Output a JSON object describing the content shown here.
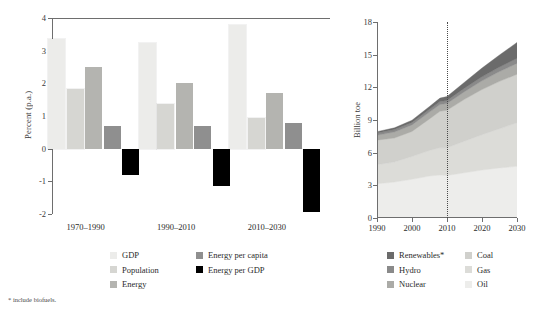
{
  "figure": {
    "footnote": "* include biofuels."
  },
  "left": {
    "ylabel": "Percent (p.a.)",
    "y_ticks": [
      "4",
      "3",
      "2",
      "1",
      "0",
      "-1",
      "-2"
    ],
    "group_labels": [
      "1970–1990",
      "1990–2010",
      "2010–2030"
    ],
    "legend": [
      {
        "label": "GDP",
        "color": "#ececea"
      },
      {
        "label": "Energy per capita",
        "color": "#8f8f8f"
      },
      {
        "label": "Population",
        "color": "#d6d6d2"
      },
      {
        "label": "Energy per GDP",
        "color": "#000000"
      },
      {
        "label": "Energy",
        "color": "#b4b4b0"
      }
    ]
  },
  "right": {
    "ylabel": "Billion toe",
    "y_ticks": [
      "18",
      "15",
      "12",
      "9",
      "6",
      "3",
      "0"
    ],
    "x_ticks": [
      "1990",
      "2000",
      "2010",
      "2020",
      "2030"
    ],
    "divider_year": 2010,
    "legend": [
      {
        "label": "Renewables*",
        "color": "#6b6b6b"
      },
      {
        "label": "Coal",
        "color": "#d0d0cc"
      },
      {
        "label": "Hydro",
        "color": "#8a8a8a"
      },
      {
        "label": "Gas",
        "color": "#dcdcd8"
      },
      {
        "label": "Nuclear",
        "color": "#ababa7"
      },
      {
        "label": "Oil",
        "color": "#ededeb"
      }
    ]
  },
  "chart_data": [
    {
      "type": "bar",
      "title": "",
      "xlabel": "",
      "ylabel": "Percent (p.a.)",
      "ylim": [
        -2,
        4
      ],
      "grid": false,
      "legend_position": "bottom-left",
      "categories": [
        "1970–1990",
        "1990–2010",
        "2010–2030"
      ],
      "series": [
        {
          "name": "GDP",
          "color": "#ececea",
          "values": [
            3.35,
            3.22,
            3.8
          ]
        },
        {
          "name": "Population",
          "color": "#d6d6d2",
          "values": [
            1.82,
            1.37,
            0.95
          ]
        },
        {
          "name": "Energy",
          "color": "#b4b4b0",
          "values": [
            2.5,
            2.0,
            1.7
          ]
        },
        {
          "name": "Energy per capita",
          "color": "#8f8f8f",
          "values": [
            0.68,
            0.68,
            0.78
          ]
        },
        {
          "name": "Energy per GDP",
          "color": "#000000",
          "values": [
            -0.8,
            -1.15,
            -1.95
          ]
        }
      ]
    },
    {
      "type": "area",
      "stacked": true,
      "title": "",
      "xlabel": "",
      "ylabel": "Billion toe",
      "xlim": [
        1990,
        2030
      ],
      "ylim": [
        0,
        18
      ],
      "grid": false,
      "legend_position": "bottom",
      "annotation": "dotted vertical line at 2010 separating history from projection",
      "x": [
        1990,
        1995,
        2000,
        2005,
        2008,
        2010,
        2015,
        2020,
        2025,
        2030
      ],
      "series": [
        {
          "name": "Oil",
          "color": "#ededeb",
          "values": [
            3.15,
            3.3,
            3.55,
            3.85,
            3.95,
            3.9,
            4.15,
            4.4,
            4.6,
            4.75
          ]
        },
        {
          "name": "Gas",
          "color": "#dcdcd8",
          "values": [
            1.75,
            1.85,
            2.1,
            2.35,
            2.5,
            2.55,
            2.9,
            3.25,
            3.6,
            4.0
          ]
        },
        {
          "name": "Coal",
          "color": "#d0d0cc",
          "values": [
            2.25,
            2.2,
            2.3,
            2.9,
            3.35,
            3.45,
            3.85,
            4.15,
            4.35,
            4.45
          ]
        },
        {
          "name": "Nuclear",
          "color": "#ababa7",
          "values": [
            0.45,
            0.55,
            0.6,
            0.63,
            0.62,
            0.62,
            0.7,
            0.8,
            0.9,
            1.0
          ]
        },
        {
          "name": "Hydro",
          "color": "#8a8a8a",
          "values": [
            0.2,
            0.22,
            0.23,
            0.25,
            0.27,
            0.28,
            0.32,
            0.37,
            0.42,
            0.47
          ]
        },
        {
          "name": "Renewables*",
          "color": "#6b6b6b",
          "values": [
            0.13,
            0.16,
            0.2,
            0.26,
            0.32,
            0.35,
            0.55,
            0.8,
            1.1,
            1.45
          ]
        }
      ]
    }
  ]
}
